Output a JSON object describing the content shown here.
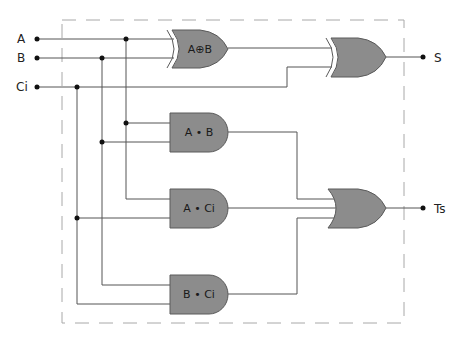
{
  "diagram": {
    "inputs": [
      {
        "label": "A"
      },
      {
        "label": "B"
      },
      {
        "label": "Ci"
      }
    ],
    "outputs": [
      {
        "label": "S"
      },
      {
        "label": "Ts"
      }
    ],
    "gates": [
      {
        "id": "xor1",
        "type": "XOR",
        "label": "A⊕B",
        "inputs": [
          "A",
          "B"
        ]
      },
      {
        "id": "xor2",
        "type": "XOR",
        "label": "",
        "inputs": [
          "xor1",
          "Ci"
        ],
        "output": "S"
      },
      {
        "id": "and1",
        "type": "AND",
        "label": "A • B",
        "inputs": [
          "A",
          "B"
        ]
      },
      {
        "id": "and2",
        "type": "AND",
        "label": "A • Ci",
        "inputs": [
          "A",
          "Ci"
        ]
      },
      {
        "id": "and3",
        "type": "AND",
        "label": "B • Ci",
        "inputs": [
          "B",
          "Ci"
        ]
      },
      {
        "id": "or1",
        "type": "OR",
        "label": "",
        "inputs": [
          "and1",
          "and2",
          "and3"
        ],
        "output": "Ts"
      }
    ],
    "colors": {
      "gate_fill": "#8c8c8c",
      "wire": "#555555",
      "border": "#a8a8a8"
    }
  }
}
